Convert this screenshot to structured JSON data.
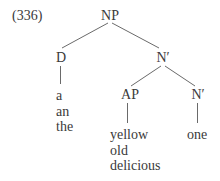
{
  "example_number": "(336)",
  "tree": {
    "root": {
      "label": "NP",
      "children": [
        {
          "label": "D",
          "terminals": [
            "a",
            "an",
            "the"
          ]
        },
        {
          "label": "N′",
          "children": [
            {
              "label": "AP",
              "terminals": [
                "yellow",
                "old",
                "delicious"
              ]
            },
            {
              "label": "N′",
              "terminals": [
                "one"
              ]
            }
          ]
        }
      ]
    }
  },
  "colors": {
    "text": "#3a3a3a",
    "lines": "#6a6a6a",
    "background": "#ffffff"
  }
}
